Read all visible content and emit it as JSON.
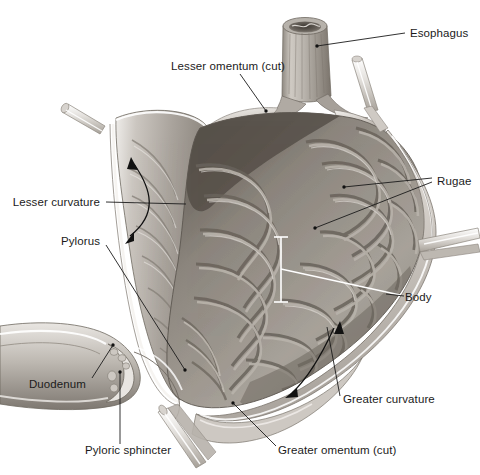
{
  "figure": {
    "background_color": "#ffffff",
    "label_color": "#1b1b1b",
    "leader_line_color": "#1b1b1b",
    "white_leader_color": "#ffffff",
    "tissue_colors": {
      "outer_serosa": "#d8d4cf",
      "wall_mid": "#b4afa9",
      "mucosa_light": "#bdb8b2",
      "mucosa_mid": "#9a948d",
      "mucosa_dark": "#6e6862",
      "cavity_shadow": "#565049",
      "vessel_stub": "#e6e3df"
    }
  },
  "labels": [
    {
      "id": "esophagus",
      "text": "Esophagus",
      "x": 410,
      "y": 33,
      "align": "left"
    },
    {
      "id": "lesser-omentum",
      "text": "Lesser omentum (cut)",
      "x": 228,
      "y": 66,
      "align": "center"
    },
    {
      "id": "rugae",
      "text": "Rugae",
      "x": 437,
      "y": 181,
      "align": "left"
    },
    {
      "id": "lesser-curvature",
      "text": "Lesser curvature",
      "x": 100,
      "y": 202,
      "align": "right"
    },
    {
      "id": "pylorus",
      "text": "Pylorus",
      "x": 100,
      "y": 241,
      "align": "right"
    },
    {
      "id": "body",
      "text": "Body",
      "x": 405,
      "y": 297,
      "align": "left"
    },
    {
      "id": "duodenum",
      "text": "Duodenum",
      "x": 86,
      "y": 384,
      "align": "right"
    },
    {
      "id": "greater-curvature",
      "text": "Greater curvature",
      "x": 343,
      "y": 399,
      "align": "left"
    },
    {
      "id": "pyloric-sphincter",
      "text": "Pyloric sphincter",
      "x": 85,
      "y": 450,
      "align": "left"
    },
    {
      "id": "greater-omentum",
      "text": "Greater omentum (cut)",
      "x": 278,
      "y": 450,
      "align": "left"
    }
  ],
  "annotations": {
    "esophagus_leader": {
      "from": [
        405,
        33
      ],
      "to": [
        317,
        46
      ]
    },
    "lesser_omentum_leader": {
      "from": [
        240,
        74
      ],
      "to": [
        266,
        111
      ]
    },
    "rugae_leader_upper": {
      "from": [
        432,
        178
      ],
      "to": [
        344,
        187
      ]
    },
    "rugae_leader_lower": {
      "from": [
        432,
        182
      ],
      "to": [
        315,
        228
      ]
    },
    "lesser_curvature_leader": {
      "from": [
        106,
        202
      ],
      "to": [
        186,
        204
      ]
    },
    "pylorus_leader": {
      "from": [
        106,
        245
      ],
      "to": [
        185,
        370
      ]
    },
    "body_leader_white": {
      "from": [
        400,
        295
      ],
      "to": [
        281,
        269
      ]
    },
    "body_bracket": {
      "x": 281,
      "y_top": 237,
      "y_bottom": 302,
      "cap_half_width": 7
    },
    "duodenum_leader": {
      "from": [
        92,
        378
      ],
      "to": [
        113,
        345
      ]
    },
    "greater_curvature_leader": {
      "from": [
        340,
        396
      ],
      "to": [
        327,
        327
      ]
    },
    "pyloric_sphincter_leader": {
      "from": [
        120,
        444
      ],
      "to": [
        120,
        372
      ]
    },
    "greater_omentum_leader": {
      "from": [
        276,
        446
      ],
      "to": [
        233,
        403
      ]
    },
    "lesser_curvature_arrow": {
      "type": "double-headed-curve",
      "head_top": [
        131,
        159
      ],
      "head_bottom": [
        127,
        241
      ]
    },
    "greater_curvature_arrow": {
      "type": "double-headed-curve",
      "head_top": [
        338,
        324
      ],
      "head_bottom": [
        288,
        397
      ]
    }
  },
  "structures": [
    {
      "name": "esophagus-tube",
      "description": "vertical cylindrical tube with open lumen at top"
    },
    {
      "name": "stomach-cavity",
      "description": "opened stomach interior showing rugae folds"
    },
    {
      "name": "lesser-curvature-wall",
      "description": "left concave wall of the stomach"
    },
    {
      "name": "greater-curvature-wall",
      "description": "right/lower convex wall of the stomach"
    },
    {
      "name": "pyloric-region",
      "description": "narrowed outlet at lower left"
    },
    {
      "name": "duodenum-segment",
      "description": "tube continuing to the left from pylorus"
    },
    {
      "name": "vessel-stub-upper-left",
      "x": 95,
      "y": 122
    },
    {
      "name": "vessel-stub-upper-right",
      "x": 360,
      "y": 92
    },
    {
      "name": "vessel-stub-right",
      "x": 440,
      "y": 250
    },
    {
      "name": "vessel-stub-bottom",
      "x": 175,
      "y": 432
    }
  ]
}
